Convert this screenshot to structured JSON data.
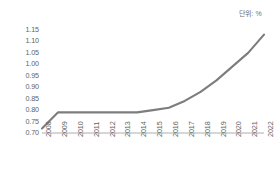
{
  "annotation": {
    "unit_note": "단위: %"
  },
  "chart_data": {
    "type": "line",
    "title": "",
    "subtitle": "",
    "xlabel": "",
    "ylabel": "",
    "unit": "%",
    "grid": false,
    "legend": "none",
    "categories": [
      "2008",
      "2009",
      "2010",
      "2011",
      "2012",
      "2013",
      "2014",
      "2015",
      "2016",
      "2017",
      "2018",
      "2019",
      "2020",
      "2021",
      "2022"
    ],
    "values": [
      0.72,
      0.79,
      0.79,
      0.79,
      0.79,
      0.79,
      0.79,
      0.8,
      0.81,
      0.84,
      0.88,
      0.93,
      0.99,
      1.05,
      1.13
    ],
    "series": [
      {
        "name": "",
        "color": "#7d7d7d",
        "values": [
          0.72,
          0.79,
          0.79,
          0.79,
          0.79,
          0.79,
          0.79,
          0.8,
          0.81,
          0.84,
          0.88,
          0.93,
          0.99,
          1.05,
          1.13
        ]
      }
    ],
    "ylim": [
      0.7,
      1.15
    ],
    "yticks": [
      "0.70",
      "0.75",
      "0.80",
      "0.85",
      "0.90",
      "0.95",
      "1.00",
      "1.05",
      "1.10",
      "1.15"
    ],
    "ytick_values": [
      0.7,
      0.75,
      0.8,
      0.85,
      0.9,
      0.95,
      1.0,
      1.05,
      1.1,
      1.15
    ],
    "xtick_labels": [
      "2008",
      "2009",
      "2010",
      "2011",
      "2012",
      "2013",
      "2014",
      "2015",
      "2016",
      "2017",
      "2018",
      "2019",
      "2020",
      "2021",
      "2022"
    ],
    "axis_color": "#c9c9c9",
    "tick_text_color": "#5f5f5f",
    "background": "#ffffff"
  },
  "layout": {
    "plot_left": 42,
    "plot_right": 264,
    "plot_top": 30,
    "plot_bottom": 133
  }
}
